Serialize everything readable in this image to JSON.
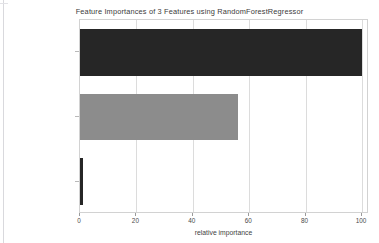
{
  "chart_data": {
    "type": "bar",
    "orientation": "horizontal",
    "title": "Feature Importances of 3 Features using RandomForestRegressor",
    "xlabel": "relative importance",
    "ylabel": "",
    "categories": [
      "TV",
      "Radio",
      "Newspaper"
    ],
    "values": [
      100,
      56,
      1
    ],
    "series": [
      {
        "name": "relative importance",
        "values": [
          100,
          56,
          1
        ]
      }
    ],
    "bar_colors": [
      "#262626",
      "#8c8c8c",
      "#262626"
    ],
    "xlim": [
      0,
      102.5
    ],
    "xticks": [
      0,
      20,
      40,
      60,
      80,
      100
    ],
    "xtick_labels": [
      "0",
      "20",
      "40",
      "60",
      "80",
      "100"
    ],
    "grid": true,
    "grid_axis": "x",
    "legend": false,
    "background": "#ffffff",
    "axes_color": "#d2d2d2",
    "grid_color": "#dcdcdc"
  },
  "figure": {
    "width": 379,
    "height": 243
  }
}
